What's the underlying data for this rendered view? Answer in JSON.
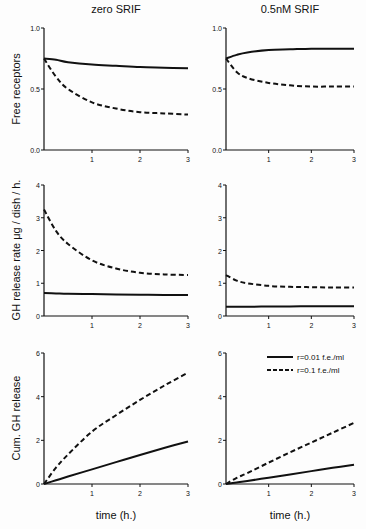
{
  "columns": [
    "zero SRIF",
    "0.5nM SRIF"
  ],
  "ylabels": [
    "Free receptors",
    "GH release rate μg / dish / h.",
    "Cum. GH release"
  ],
  "xlabel": "time (h.)",
  "legend": {
    "solid": "r=0.01 f.e./ml",
    "dashed": "r=0.1 f.e./ml"
  },
  "chart_data": [
    {
      "type": "line",
      "title": "zero SRIF",
      "ylabel": "Free receptors",
      "xlabel": "",
      "x": [
        0,
        0.25,
        0.5,
        1,
        1.5,
        2,
        2.5,
        3
      ],
      "xlim": [
        0,
        3
      ],
      "ylim": [
        0,
        1
      ],
      "yticks": [
        0.0,
        0.5,
        1.0
      ],
      "xticks": [
        1,
        2,
        3
      ],
      "series": [
        {
          "name": "r=0.01 f.e./ml",
          "style": "solid",
          "values": [
            0.75,
            0.74,
            0.72,
            0.7,
            0.69,
            0.68,
            0.675,
            0.67
          ]
        },
        {
          "name": "r=0.1 f.e./ml",
          "style": "dashed",
          "values": [
            0.75,
            0.6,
            0.5,
            0.39,
            0.34,
            0.31,
            0.3,
            0.29
          ]
        }
      ]
    },
    {
      "type": "line",
      "title": "0.5nM SRIF",
      "ylabel": "",
      "xlabel": "",
      "x": [
        0,
        0.25,
        0.5,
        1,
        1.5,
        2,
        2.5,
        3
      ],
      "xlim": [
        0,
        3
      ],
      "ylim": [
        0,
        1
      ],
      "yticks": [
        0.0,
        0.5,
        1.0
      ],
      "xticks": [
        1,
        2,
        3
      ],
      "series": [
        {
          "name": "r=0.01 f.e./ml",
          "style": "solid",
          "values": [
            0.75,
            0.78,
            0.8,
            0.82,
            0.825,
            0.83,
            0.83,
            0.83
          ]
        },
        {
          "name": "r=0.1 f.e./ml",
          "style": "dashed",
          "values": [
            0.75,
            0.64,
            0.59,
            0.55,
            0.53,
            0.52,
            0.52,
            0.52
          ]
        }
      ]
    },
    {
      "type": "line",
      "title": "",
      "ylabel": "GH release rate μg / dish / h.",
      "xlabel": "",
      "x": [
        0,
        0.25,
        0.5,
        1,
        1.5,
        2,
        2.5,
        3
      ],
      "xlim": [
        0,
        3
      ],
      "ylim": [
        0,
        4
      ],
      "yticks": [
        0,
        1,
        2,
        3,
        4
      ],
      "xticks": [
        1,
        2,
        3
      ],
      "series": [
        {
          "name": "r=0.01 f.e./ml",
          "style": "solid",
          "values": [
            0.7,
            0.69,
            0.68,
            0.67,
            0.66,
            0.65,
            0.64,
            0.64
          ]
        },
        {
          "name": "r=0.1 f.e./ml",
          "style": "dashed",
          "values": [
            3.25,
            2.6,
            2.2,
            1.7,
            1.45,
            1.32,
            1.27,
            1.25
          ]
        }
      ]
    },
    {
      "type": "line",
      "title": "",
      "ylabel": "",
      "xlabel": "",
      "x": [
        0,
        0.25,
        0.5,
        1,
        1.5,
        2,
        2.5,
        3
      ],
      "xlim": [
        0,
        3
      ],
      "ylim": [
        0,
        4
      ],
      "yticks": [
        0,
        1,
        2,
        3,
        4
      ],
      "xticks": [
        1,
        2,
        3
      ],
      "series": [
        {
          "name": "r=0.01 f.e./ml",
          "style": "solid",
          "values": [
            0.28,
            0.28,
            0.28,
            0.29,
            0.29,
            0.3,
            0.3,
            0.3
          ]
        },
        {
          "name": "r=0.1 f.e./ml",
          "style": "dashed",
          "values": [
            1.25,
            1.08,
            1.0,
            0.92,
            0.89,
            0.88,
            0.87,
            0.87
          ]
        }
      ]
    },
    {
      "type": "line",
      "title": "",
      "ylabel": "Cum. GH release",
      "xlabel": "time (h.)",
      "x": [
        0,
        0.25,
        0.5,
        1,
        1.5,
        2,
        2.5,
        3
      ],
      "xlim": [
        0,
        3
      ],
      "ylim": [
        0,
        6
      ],
      "yticks": [
        0,
        2,
        4,
        6
      ],
      "xticks": [
        1,
        2,
        3
      ],
      "series": [
        {
          "name": "r=0.01 f.e./ml",
          "style": "solid",
          "values": [
            0,
            0.17,
            0.34,
            0.67,
            1.0,
            1.33,
            1.65,
            1.95
          ]
        },
        {
          "name": "r=0.1 f.e./ml",
          "style": "dashed",
          "values": [
            0,
            0.75,
            1.35,
            2.4,
            3.15,
            3.85,
            4.5,
            5.1
          ]
        }
      ]
    },
    {
      "type": "line",
      "title": "",
      "ylabel": "",
      "xlabel": "time (h.)",
      "x": [
        0,
        0.25,
        0.5,
        1,
        1.5,
        2,
        2.5,
        3
      ],
      "xlim": [
        0,
        3
      ],
      "ylim": [
        0,
        6
      ],
      "yticks": [
        0,
        2,
        4,
        6
      ],
      "xticks": [
        1,
        2,
        3
      ],
      "series": [
        {
          "name": "r=0.01 f.e./ml",
          "style": "solid",
          "values": [
            0,
            0.07,
            0.14,
            0.29,
            0.44,
            0.59,
            0.74,
            0.88
          ]
        },
        {
          "name": "r=0.1 f.e./ml",
          "style": "dashed",
          "values": [
            0,
            0.28,
            0.5,
            0.98,
            1.45,
            1.9,
            2.35,
            2.8
          ]
        }
      ],
      "legend": {
        "position": "upper right",
        "entries": [
          "r=0.01 f.e./ml",
          "r=0.1 f.e./ml"
        ]
      }
    }
  ]
}
